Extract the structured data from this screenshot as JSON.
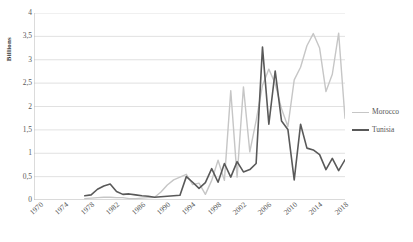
{
  "chart_data": {
    "type": "line",
    "title": "",
    "xlabel": "",
    "ylabel": "Billions",
    "ylim": [
      0,
      4
    ],
    "xlim": [
      1970,
      2019
    ],
    "grid": true,
    "legend_position": "right",
    "y_ticks": [
      "0",
      "0,5",
      "1",
      "1,5",
      "2",
      "2,5",
      "3",
      "3,5",
      "4"
    ],
    "y_tick_values": [
      0,
      0.5,
      1,
      1.5,
      2,
      2.5,
      3,
      3.5,
      4
    ],
    "x_ticks": [
      "1970",
      "1974",
      "1978",
      "1982",
      "1986",
      "1990",
      "1994",
      "1998",
      "2002",
      "2006",
      "2010",
      "2014",
      "2018"
    ],
    "x_tick_values": [
      1970,
      1974,
      1978,
      1982,
      1986,
      1990,
      1994,
      1998,
      2002,
      2006,
      2010,
      2014,
      2018
    ],
    "x": [
      1970,
      1971,
      1972,
      1973,
      1974,
      1975,
      1976,
      1977,
      1978,
      1979,
      1980,
      1981,
      1982,
      1983,
      1984,
      1985,
      1986,
      1987,
      1988,
      1989,
      1990,
      1991,
      1992,
      1993,
      1994,
      1995,
      1996,
      1997,
      1998,
      1999,
      2000,
      2001,
      2002,
      2003,
      2004,
      2005,
      2006,
      2007,
      2008,
      2009,
      2010,
      2011,
      2012,
      2013,
      2014,
      2015,
      2016,
      2017,
      2018,
      2019
    ],
    "series": [
      {
        "name": "Morocco",
        "color": "#c6c6c6",
        "width": 1.4,
        "values": [
          null,
          null,
          null,
          null,
          null,
          null,
          null,
          null,
          0.03,
          0.04,
          0.05,
          0.06,
          0.06,
          0.05,
          0.05,
          0.03,
          0.03,
          0.04,
          0.05,
          0.06,
          0.17,
          0.32,
          0.43,
          0.49,
          0.55,
          0.33,
          0.36,
          0.12,
          0.42,
          0.85,
          0.42,
          2.34,
          0.49,
          2.42,
          1.03,
          1.7,
          2.45,
          2.8,
          2.49,
          1.95,
          1.57,
          2.57,
          2.84,
          3.3,
          3.56,
          3.25,
          2.32,
          2.69,
          3.57,
          1.75
        ]
      },
      {
        "name": "Tunisia",
        "color": "#595959",
        "width": 1.6,
        "values": [
          null,
          null,
          null,
          null,
          null,
          null,
          null,
          null,
          0.09,
          0.11,
          0.23,
          0.3,
          0.34,
          0.18,
          0.12,
          0.13,
          0.11,
          0.09,
          0.08,
          0.06,
          0.07,
          0.08,
          0.09,
          0.1,
          0.5,
          0.38,
          0.25,
          0.37,
          0.67,
          0.38,
          0.78,
          0.49,
          0.82,
          0.6,
          0.65,
          0.78,
          3.27,
          1.62,
          2.76,
          1.69,
          1.51,
          0.43,
          1.62,
          1.11,
          1.07,
          0.97,
          0.65,
          0.89,
          0.63,
          0.86
        ]
      }
    ]
  },
  "legend": {
    "items": [
      {
        "label": "Morocco",
        "color": "#c6c6c6"
      },
      {
        "label": "Tunisia",
        "color": "#595959"
      }
    ]
  },
  "axis": {
    "y_title": "Billions"
  }
}
